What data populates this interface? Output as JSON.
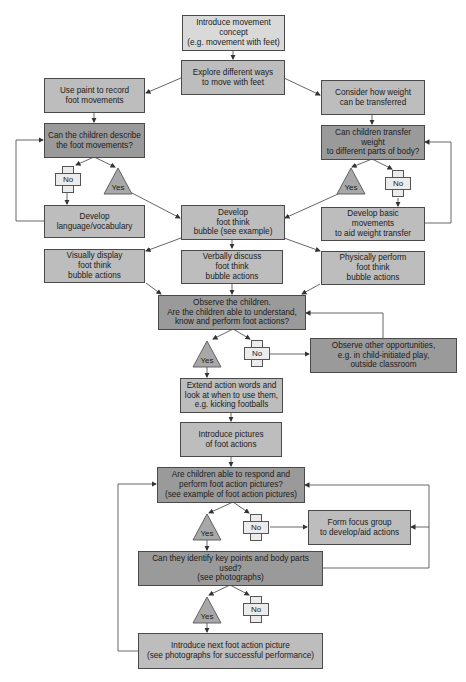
{
  "flowchart": {
    "nodes": {
      "introduce_concept": "Introduce movement\nconcept\n(e.g. movement with feet)",
      "explore_ways": "Explore different ways\nto move with feet",
      "use_paint": "Use paint to record\nfoot movements",
      "consider_weight": "Consider how weight\ncan be transferred",
      "describe_q": "Can the children describe\nthe foot movements?",
      "transfer_q": "Can children transfer weight\nto different parts of body?",
      "develop_language": "Develop\nlanguage/vocabulary",
      "develop_bubble": "Develop\nfoot think\nbubble (see example)",
      "develop_basic": "Develop basic movements\nto aid weight transfer",
      "visually_display": "Visually display\nfoot think\nbubble actions",
      "verbally_discuss": "Verbally discuss\nfoot think\nbubble actions",
      "physically_perform": "Physically perform\nfoot think\nbubble actions",
      "observe_children": "Observe the children.\nAre the children able to understand,\nknow and perform foot actions?",
      "observe_other": "Observe other opportunities,\ne.g. in child-initiated play,\noutside classroom",
      "extend_words": "Extend action words and\nlook at when to use them,\ne.g. kicking footballs",
      "introduce_pictures": "Introduce pictures\nof foot actions",
      "respond_q": "Are children able to respond and\nperform foot action pictures?\n(see example of foot action pictures)",
      "focus_group": "Form focus group\nto develop/aid actions",
      "identify_q": "Can they identify key points and body parts used?\n(see photographs)",
      "introduce_next": "Introduce next foot action picture\n(see photographs for successful performance)"
    },
    "labels": {
      "yes": "Yes",
      "no": "No"
    },
    "colors": {
      "light": "#d9d9d9",
      "mid": "#bdbdbd",
      "dark": "#9a9a9a",
      "no_shape": "#ececec",
      "yes_shape": "#a8a8a8",
      "line": "#555555"
    }
  }
}
